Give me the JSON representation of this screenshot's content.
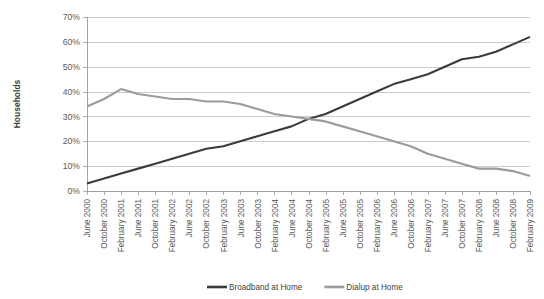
{
  "chart_data": {
    "type": "line",
    "title": "",
    "xlabel": "",
    "ylabel": "Households",
    "ylim": [
      0,
      70
    ],
    "ytick_values": [
      0,
      10,
      20,
      30,
      40,
      50,
      60,
      70
    ],
    "ytick_labels": [
      "0%",
      "10%",
      "20%",
      "30%",
      "40%",
      "50%",
      "60%",
      "70%"
    ],
    "grid": true,
    "legend_position": "bottom",
    "categories": [
      "June 2000",
      "October 2000",
      "February 2001",
      "June 2001",
      "October 2001",
      "February 2002",
      "June 2002",
      "October 2002",
      "February 2003",
      "June 2003",
      "October 2003",
      "February 2004",
      "June 2004",
      "October 2004",
      "February 2005",
      "June 2005",
      "October 2005",
      "February 2006",
      "June 2006",
      "October 2006",
      "February 2007",
      "June 2007",
      "October 2007",
      "February 2008",
      "June 2008",
      "October 2008",
      "February 2009"
    ],
    "series": [
      {
        "name": "Broadband at Home",
        "color": "#3b3b3b",
        "values": [
          3,
          5,
          7,
          9,
          11,
          13,
          15,
          17,
          18,
          20,
          22,
          24,
          26,
          29,
          31,
          34,
          37,
          40,
          43,
          45,
          47,
          50,
          53,
          54,
          56,
          59,
          62
        ]
      },
      {
        "name": "Dialup at Home",
        "color": "#9b9b9b",
        "values": [
          34,
          37,
          41,
          39,
          38,
          37,
          37,
          36,
          36,
          35,
          33,
          31,
          30,
          29,
          28,
          26,
          24,
          22,
          20,
          18,
          15,
          13,
          11,
          9,
          9,
          8,
          6
        ]
      }
    ],
    "legend": [
      {
        "label": "Broadband at Home",
        "color": "#3b3b3b"
      },
      {
        "label": "Dialup at Home",
        "color": "#9b9b9b"
      }
    ]
  },
  "layout": {
    "plot_left": 87,
    "plot_right": 530,
    "plot_top": 17,
    "plot_bottom": 191
  }
}
